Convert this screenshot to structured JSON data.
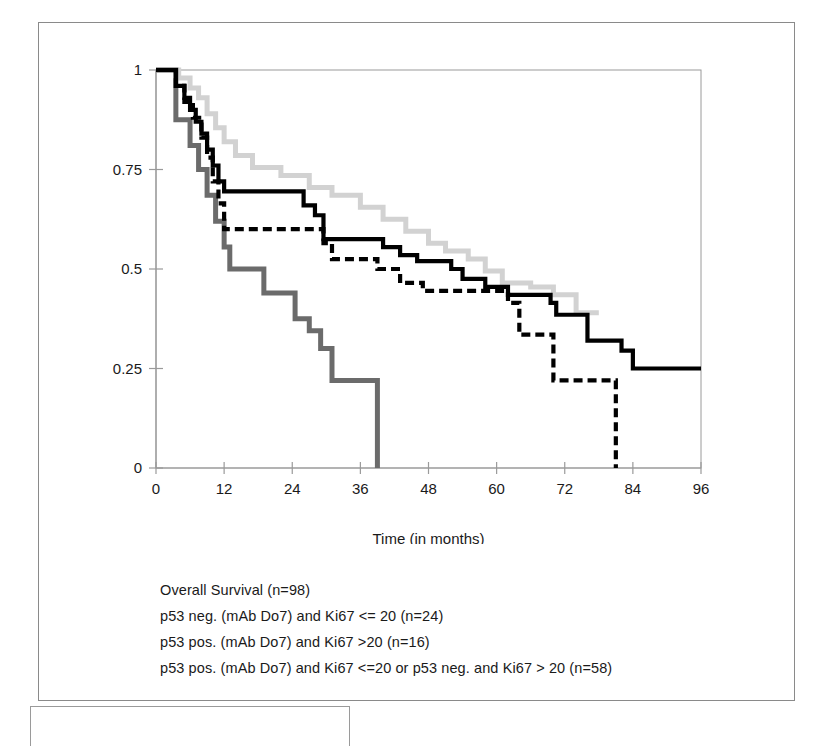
{
  "chart_data": {
    "type": "line",
    "title": "",
    "subtitle": "",
    "xlabel": "Time (in months)",
    "ylabel": "",
    "xlim": [
      0,
      96
    ],
    "ylim": [
      0,
      1
    ],
    "xticks": [
      0,
      12,
      24,
      36,
      48,
      60,
      72,
      84,
      96
    ],
    "xtick_labels": [
      "0",
      "12",
      "24",
      "36",
      "48",
      "60",
      "72",
      "84",
      "96"
    ],
    "yticks": [
      0,
      0.25,
      0.5,
      0.75,
      1
    ],
    "ytick_labels": [
      "0",
      "0.25",
      "0.5",
      "0.75",
      "1"
    ],
    "grid": false,
    "legend_position": "below-plot",
    "step_type": "post",
    "series": [
      {
        "name": "Overall Survival (n=98)",
        "style": "solid",
        "color": "#000000",
        "marker": "solid-line",
        "points": [
          [
            0,
            1.0
          ],
          [
            3.5,
            1.0
          ],
          [
            3.5,
            0.96
          ],
          [
            5.0,
            0.96
          ],
          [
            5.0,
            0.93
          ],
          [
            6.0,
            0.93
          ],
          [
            6.0,
            0.9
          ],
          [
            7.0,
            0.9
          ],
          [
            7.0,
            0.87
          ],
          [
            8.0,
            0.87
          ],
          [
            8.0,
            0.84
          ],
          [
            9.0,
            0.84
          ],
          [
            9.0,
            0.8
          ],
          [
            10.0,
            0.8
          ],
          [
            10.0,
            0.76
          ],
          [
            11.0,
            0.76
          ],
          [
            11.0,
            0.72
          ],
          [
            12.0,
            0.72
          ],
          [
            12.0,
            0.695
          ],
          [
            26.0,
            0.695
          ],
          [
            26.0,
            0.66
          ],
          [
            28.0,
            0.66
          ],
          [
            28.0,
            0.635
          ],
          [
            29.5,
            0.635
          ],
          [
            29.5,
            0.575
          ],
          [
            40.0,
            0.575
          ],
          [
            40.0,
            0.555
          ],
          [
            43.0,
            0.555
          ],
          [
            43.0,
            0.535
          ],
          [
            46.0,
            0.535
          ],
          [
            46.0,
            0.52
          ],
          [
            52.0,
            0.52
          ],
          [
            52.0,
            0.5
          ],
          [
            54.0,
            0.5
          ],
          [
            54.0,
            0.475
          ],
          [
            58.0,
            0.475
          ],
          [
            58.0,
            0.455
          ],
          [
            62.0,
            0.455
          ],
          [
            62.0,
            0.435
          ],
          [
            69.5,
            0.435
          ],
          [
            69.5,
            0.415
          ],
          [
            70.5,
            0.415
          ],
          [
            70.5,
            0.385
          ],
          [
            76.0,
            0.385
          ],
          [
            76.0,
            0.32
          ],
          [
            82.0,
            0.32
          ],
          [
            82.0,
            0.295
          ],
          [
            84.0,
            0.295
          ],
          [
            84.0,
            0.25
          ],
          [
            96.0,
            0.25
          ]
        ]
      },
      {
        "name": "p53 neg. (mAb Do7) and Ki67 <= 20 (n=24)",
        "style": "dashed",
        "color": "#000000",
        "marker": "dashed-line",
        "points": [
          [
            0,
            1.0
          ],
          [
            3.5,
            1.0
          ],
          [
            3.5,
            0.96
          ],
          [
            5.0,
            0.96
          ],
          [
            5.0,
            0.92
          ],
          [
            6.5,
            0.92
          ],
          [
            6.5,
            0.88
          ],
          [
            8.0,
            0.88
          ],
          [
            8.0,
            0.83
          ],
          [
            9.0,
            0.83
          ],
          [
            9.0,
            0.78
          ],
          [
            10.0,
            0.78
          ],
          [
            10.0,
            0.72
          ],
          [
            11.0,
            0.72
          ],
          [
            11.0,
            0.665
          ],
          [
            12.0,
            0.665
          ],
          [
            12.0,
            0.6
          ],
          [
            29.5,
            0.6
          ],
          [
            29.5,
            0.565
          ],
          [
            31.0,
            0.565
          ],
          [
            31.0,
            0.525
          ],
          [
            39.0,
            0.525
          ],
          [
            39.0,
            0.5
          ],
          [
            43.0,
            0.5
          ],
          [
            43.0,
            0.465
          ],
          [
            47.0,
            0.465
          ],
          [
            47.0,
            0.445
          ],
          [
            62.0,
            0.445
          ],
          [
            62.0,
            0.415
          ],
          [
            64.0,
            0.415
          ],
          [
            64.0,
            0.335
          ],
          [
            70.0,
            0.335
          ],
          [
            70.0,
            0.22
          ],
          [
            81.0,
            0.22
          ],
          [
            81.0,
            0.0
          ]
        ]
      },
      {
        "name": "p53 pos. (mAb Do7) and Ki67 >20 (n=16)",
        "style": "gray-thick",
        "color": "#6b6b6b",
        "marker": "gray-line",
        "points": [
          [
            0,
            1.0
          ],
          [
            3.5,
            1.0
          ],
          [
            3.5,
            0.875
          ],
          [
            6.0,
            0.875
          ],
          [
            6.0,
            0.81
          ],
          [
            7.5,
            0.81
          ],
          [
            7.5,
            0.75
          ],
          [
            9.0,
            0.75
          ],
          [
            9.0,
            0.685
          ],
          [
            10.5,
            0.685
          ],
          [
            10.5,
            0.62
          ],
          [
            12.0,
            0.62
          ],
          [
            12.0,
            0.555
          ],
          [
            13.0,
            0.555
          ],
          [
            13.0,
            0.5
          ],
          [
            19.0,
            0.5
          ],
          [
            19.0,
            0.44
          ],
          [
            24.5,
            0.44
          ],
          [
            24.5,
            0.375
          ],
          [
            27.0,
            0.375
          ],
          [
            27.0,
            0.345
          ],
          [
            29.0,
            0.345
          ],
          [
            29.0,
            0.3
          ],
          [
            31.0,
            0.3
          ],
          [
            31.0,
            0.22
          ],
          [
            39.0,
            0.22
          ],
          [
            39.0,
            0.0
          ]
        ]
      },
      {
        "name": "p53 pos. (mAb Do7) and Ki67 <=20 or p53 neg. and Ki67 > 20 (n=58)",
        "style": "light-gray",
        "color": "#cfcfcf",
        "marker": "light-gray-line",
        "points": [
          [
            0,
            1.0
          ],
          [
            4.0,
            1.0
          ],
          [
            4.0,
            0.98
          ],
          [
            6.0,
            0.98
          ],
          [
            6.0,
            0.955
          ],
          [
            7.5,
            0.955
          ],
          [
            7.5,
            0.93
          ],
          [
            9.0,
            0.93
          ],
          [
            9.0,
            0.89
          ],
          [
            10.5,
            0.89
          ],
          [
            10.5,
            0.855
          ],
          [
            12.0,
            0.855
          ],
          [
            12.0,
            0.82
          ],
          [
            14.0,
            0.82
          ],
          [
            14.0,
            0.785
          ],
          [
            17.0,
            0.785
          ],
          [
            17.0,
            0.755
          ],
          [
            22.0,
            0.755
          ],
          [
            22.0,
            0.735
          ],
          [
            27.0,
            0.735
          ],
          [
            27.0,
            0.705
          ],
          [
            31.0,
            0.705
          ],
          [
            31.0,
            0.685
          ],
          [
            36.0,
            0.685
          ],
          [
            36.0,
            0.655
          ],
          [
            40.0,
            0.655
          ],
          [
            40.0,
            0.625
          ],
          [
            44.0,
            0.625
          ],
          [
            44.0,
            0.595
          ],
          [
            48.0,
            0.595
          ],
          [
            48.0,
            0.565
          ],
          [
            51.0,
            0.565
          ],
          [
            51.0,
            0.545
          ],
          [
            55.0,
            0.545
          ],
          [
            55.0,
            0.525
          ],
          [
            58.0,
            0.525
          ],
          [
            58.0,
            0.495
          ],
          [
            61.0,
            0.495
          ],
          [
            61.0,
            0.465
          ],
          [
            66.0,
            0.465
          ],
          [
            66.0,
            0.455
          ],
          [
            70.0,
            0.455
          ],
          [
            70.0,
            0.435
          ],
          [
            74.0,
            0.435
          ],
          [
            74.0,
            0.39
          ],
          [
            78.0,
            0.39
          ]
        ]
      }
    ]
  },
  "legend": {
    "items": [
      {
        "label": "Overall Survival (n=98)",
        "swatch": "solid-line-swatch"
      },
      {
        "label": "p53 neg. (mAb Do7) and Ki67 <= 20 (n=24)",
        "swatch": "dashed-line-swatch"
      },
      {
        "label": "p53 pos. (mAb Do7) and Ki67 >20 (n=16)",
        "swatch": "gray-line-swatch"
      },
      {
        "label": "p53 pos. (mAb Do7) and Ki67 <=20 or p53 neg. and Ki67 > 20 (n=58)",
        "swatch": "light-gray-line-swatch"
      }
    ]
  },
  "colors": {
    "overall_survival": "#000000",
    "p53_neg_ki67_low": "#000000",
    "p53_pos_ki67_high": "#6b6b6b",
    "mixed_group": "#cfcfcf",
    "axis": "#9a9a9a",
    "frame": "#8a8a8a"
  }
}
